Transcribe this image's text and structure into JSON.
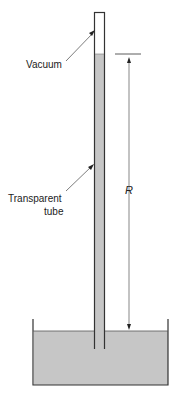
{
  "diagram": {
    "type": "barometer",
    "labels": {
      "vacuum": "Vacuum",
      "tube_line1": "Transparent",
      "tube_line2": "tube",
      "height_symbol": "R"
    },
    "colors": {
      "liquid": "#c6c6c6",
      "outline": "#333333",
      "background": "#ffffff",
      "text": "#222222"
    }
  }
}
